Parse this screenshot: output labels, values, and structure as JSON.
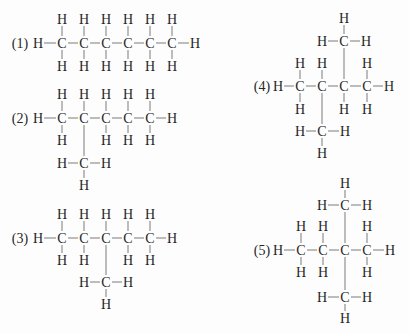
{
  "colors": {
    "text": "#262626",
    "bond": "#9a9a9a",
    "background": "#fdfdfd"
  },
  "molecules": [
    {
      "id": 1,
      "label": "(1)",
      "label_pos": [
        20,
        43
      ],
      "atoms": [
        {
          "el": "H",
          "x": 38,
          "y": 43
        },
        {
          "el": "C",
          "x": 62,
          "y": 43
        },
        {
          "el": "H",
          "x": 62,
          "y": 19
        },
        {
          "el": "H",
          "x": 62,
          "y": 66
        },
        {
          "el": "C",
          "x": 84,
          "y": 43
        },
        {
          "el": "H",
          "x": 84,
          "y": 19
        },
        {
          "el": "H",
          "x": 84,
          "y": 66
        },
        {
          "el": "C",
          "x": 106,
          "y": 43
        },
        {
          "el": "H",
          "x": 106,
          "y": 19
        },
        {
          "el": "H",
          "x": 106,
          "y": 66
        },
        {
          "el": "C",
          "x": 128,
          "y": 43
        },
        {
          "el": "H",
          "x": 128,
          "y": 19
        },
        {
          "el": "H",
          "x": 128,
          "y": 66
        },
        {
          "el": "C",
          "x": 150,
          "y": 43
        },
        {
          "el": "H",
          "x": 150,
          "y": 19
        },
        {
          "el": "H",
          "x": 150,
          "y": 66
        },
        {
          "el": "C",
          "x": 172,
          "y": 43
        },
        {
          "el": "H",
          "x": 172,
          "y": 19
        },
        {
          "el": "H",
          "x": 172,
          "y": 66
        },
        {
          "el": "H",
          "x": 195,
          "y": 43
        }
      ],
      "bonds": [
        [
          0,
          1
        ],
        [
          1,
          2
        ],
        [
          1,
          3
        ],
        [
          1,
          4
        ],
        [
          4,
          5
        ],
        [
          4,
          6
        ],
        [
          4,
          7
        ],
        [
          7,
          8
        ],
        [
          7,
          9
        ],
        [
          7,
          10
        ],
        [
          10,
          11
        ],
        [
          10,
          12
        ],
        [
          10,
          13
        ],
        [
          13,
          14
        ],
        [
          13,
          15
        ],
        [
          13,
          16
        ],
        [
          16,
          17
        ],
        [
          16,
          18
        ],
        [
          16,
          19
        ]
      ]
    },
    {
      "id": 2,
      "label": "(2)",
      "label_pos": [
        20,
        118
      ],
      "atoms": [
        {
          "el": "H",
          "x": 38,
          "y": 118
        },
        {
          "el": "C",
          "x": 62,
          "y": 118
        },
        {
          "el": "H",
          "x": 62,
          "y": 94
        },
        {
          "el": "H",
          "x": 62,
          "y": 140
        },
        {
          "el": "C",
          "x": 84,
          "y": 118
        },
        {
          "el": "H",
          "x": 84,
          "y": 94
        },
        {
          "el": "C",
          "x": 106,
          "y": 118
        },
        {
          "el": "H",
          "x": 106,
          "y": 94
        },
        {
          "el": "H",
          "x": 106,
          "y": 140
        },
        {
          "el": "C",
          "x": 128,
          "y": 118
        },
        {
          "el": "H",
          "x": 128,
          "y": 94
        },
        {
          "el": "H",
          "x": 128,
          "y": 140
        },
        {
          "el": "C",
          "x": 150,
          "y": 118
        },
        {
          "el": "H",
          "x": 150,
          "y": 94
        },
        {
          "el": "H",
          "x": 150,
          "y": 140
        },
        {
          "el": "H",
          "x": 172,
          "y": 118
        },
        {
          "el": "C",
          "x": 84,
          "y": 163
        },
        {
          "el": "H",
          "x": 62,
          "y": 163
        },
        {
          "el": "H",
          "x": 106,
          "y": 163
        },
        {
          "el": "H",
          "x": 84,
          "y": 185
        }
      ],
      "bonds": [
        [
          0,
          1
        ],
        [
          1,
          2
        ],
        [
          1,
          3
        ],
        [
          1,
          4
        ],
        [
          4,
          5
        ],
        [
          4,
          6
        ],
        [
          6,
          7
        ],
        [
          6,
          8
        ],
        [
          6,
          9
        ],
        [
          9,
          10
        ],
        [
          9,
          11
        ],
        [
          9,
          12
        ],
        [
          12,
          13
        ],
        [
          12,
          14
        ],
        [
          12,
          15
        ],
        [
          4,
          16
        ],
        [
          16,
          17
        ],
        [
          16,
          18
        ],
        [
          16,
          19
        ]
      ]
    },
    {
      "id": 3,
      "label": "(3)",
      "label_pos": [
        20,
        238
      ],
      "atoms": [
        {
          "el": "H",
          "x": 38,
          "y": 238
        },
        {
          "el": "C",
          "x": 62,
          "y": 238
        },
        {
          "el": "H",
          "x": 62,
          "y": 214
        },
        {
          "el": "H",
          "x": 62,
          "y": 260
        },
        {
          "el": "C",
          "x": 84,
          "y": 238
        },
        {
          "el": "H",
          "x": 84,
          "y": 214
        },
        {
          "el": "H",
          "x": 84,
          "y": 260
        },
        {
          "el": "C",
          "x": 106,
          "y": 238
        },
        {
          "el": "H",
          "x": 106,
          "y": 214
        },
        {
          "el": "C",
          "x": 128,
          "y": 238
        },
        {
          "el": "H",
          "x": 128,
          "y": 214
        },
        {
          "el": "H",
          "x": 128,
          "y": 260
        },
        {
          "el": "C",
          "x": 150,
          "y": 238
        },
        {
          "el": "H",
          "x": 150,
          "y": 214
        },
        {
          "el": "H",
          "x": 150,
          "y": 260
        },
        {
          "el": "H",
          "x": 172,
          "y": 238
        },
        {
          "el": "C",
          "x": 106,
          "y": 282
        },
        {
          "el": "H",
          "x": 84,
          "y": 282
        },
        {
          "el": "H",
          "x": 128,
          "y": 282
        },
        {
          "el": "H",
          "x": 106,
          "y": 304
        }
      ],
      "bonds": [
        [
          0,
          1
        ],
        [
          1,
          2
        ],
        [
          1,
          3
        ],
        [
          1,
          4
        ],
        [
          4,
          5
        ],
        [
          4,
          6
        ],
        [
          4,
          7
        ],
        [
          7,
          8
        ],
        [
          7,
          9
        ],
        [
          9,
          10
        ],
        [
          9,
          11
        ],
        [
          9,
          12
        ],
        [
          12,
          13
        ],
        [
          12,
          14
        ],
        [
          12,
          15
        ],
        [
          7,
          16
        ],
        [
          16,
          17
        ],
        [
          16,
          18
        ],
        [
          16,
          19
        ]
      ]
    },
    {
      "id": 4,
      "label": "(4)",
      "label_pos": [
        262,
        86
      ],
      "atoms": [
        {
          "el": "H",
          "x": 278,
          "y": 86
        },
        {
          "el": "C",
          "x": 300,
          "y": 86
        },
        {
          "el": "H",
          "x": 300,
          "y": 63
        },
        {
          "el": "H",
          "x": 300,
          "y": 109
        },
        {
          "el": "C",
          "x": 322,
          "y": 86
        },
        {
          "el": "H",
          "x": 322,
          "y": 63
        },
        {
          "el": "C",
          "x": 344,
          "y": 86
        },
        {
          "el": "H",
          "x": 344,
          "y": 109
        },
        {
          "el": "C",
          "x": 367,
          "y": 86
        },
        {
          "el": "H",
          "x": 367,
          "y": 63
        },
        {
          "el": "H",
          "x": 367,
          "y": 109
        },
        {
          "el": "H",
          "x": 389,
          "y": 86
        },
        {
          "el": "C",
          "x": 344,
          "y": 41
        },
        {
          "el": "H",
          "x": 322,
          "y": 41
        },
        {
          "el": "H",
          "x": 366,
          "y": 41
        },
        {
          "el": "H",
          "x": 344,
          "y": 18
        },
        {
          "el": "C",
          "x": 322,
          "y": 131
        },
        {
          "el": "H",
          "x": 300,
          "y": 131
        },
        {
          "el": "H",
          "x": 345,
          "y": 131
        },
        {
          "el": "H",
          "x": 322,
          "y": 153
        }
      ],
      "bonds": [
        [
          0,
          1
        ],
        [
          1,
          2
        ],
        [
          1,
          3
        ],
        [
          1,
          4
        ],
        [
          4,
          5
        ],
        [
          4,
          6
        ],
        [
          6,
          7
        ],
        [
          6,
          8
        ],
        [
          8,
          9
        ],
        [
          8,
          10
        ],
        [
          8,
          11
        ],
        [
          6,
          12
        ],
        [
          12,
          13
        ],
        [
          12,
          14
        ],
        [
          12,
          15
        ],
        [
          4,
          16
        ],
        [
          16,
          17
        ],
        [
          16,
          18
        ],
        [
          16,
          19
        ]
      ]
    },
    {
      "id": 5,
      "label": "(5)",
      "label_pos": [
        262,
        250
      ],
      "atoms": [
        {
          "el": "H",
          "x": 278,
          "y": 250
        },
        {
          "el": "C",
          "x": 301,
          "y": 250
        },
        {
          "el": "H",
          "x": 301,
          "y": 226
        },
        {
          "el": "H",
          "x": 301,
          "y": 272
        },
        {
          "el": "C",
          "x": 323,
          "y": 250
        },
        {
          "el": "H",
          "x": 323,
          "y": 226
        },
        {
          "el": "H",
          "x": 323,
          "y": 272
        },
        {
          "el": "C",
          "x": 345,
          "y": 250
        },
        {
          "el": "C",
          "x": 367,
          "y": 250
        },
        {
          "el": "H",
          "x": 367,
          "y": 226
        },
        {
          "el": "H",
          "x": 367,
          "y": 272
        },
        {
          "el": "H",
          "x": 390,
          "y": 250
        },
        {
          "el": "C",
          "x": 345,
          "y": 205
        },
        {
          "el": "H",
          "x": 322,
          "y": 205
        },
        {
          "el": "H",
          "x": 367,
          "y": 205
        },
        {
          "el": "H",
          "x": 345,
          "y": 183
        },
        {
          "el": "C",
          "x": 345,
          "y": 297
        },
        {
          "el": "H",
          "x": 322,
          "y": 297
        },
        {
          "el": "H",
          "x": 367,
          "y": 297
        },
        {
          "el": "H",
          "x": 345,
          "y": 318
        }
      ],
      "bonds": [
        [
          0,
          1
        ],
        [
          1,
          2
        ],
        [
          1,
          3
        ],
        [
          1,
          4
        ],
        [
          4,
          5
        ],
        [
          4,
          6
        ],
        [
          4,
          7
        ],
        [
          7,
          8
        ],
        [
          8,
          9
        ],
        [
          8,
          10
        ],
        [
          8,
          11
        ],
        [
          7,
          12
        ],
        [
          12,
          13
        ],
        [
          12,
          14
        ],
        [
          12,
          15
        ],
        [
          7,
          16
        ],
        [
          16,
          17
        ],
        [
          16,
          18
        ],
        [
          16,
          19
        ]
      ]
    }
  ]
}
